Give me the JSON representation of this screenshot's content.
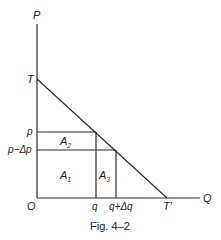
{
  "figure": {
    "caption": "Fig. 4–2",
    "axes": {
      "y_label": "P",
      "x_label": "Q",
      "origin_label": "O"
    },
    "points": {
      "t_label": "T",
      "t_prime_label": "T′",
      "p_label": "p",
      "p_minus_dp_label": "p−Δp",
      "q_label": "q",
      "q_plus_dq_label": "q+Δq"
    },
    "regions": {
      "a1": {
        "base": "A",
        "sub": "1"
      },
      "a2": {
        "base": "A",
        "sub": "2"
      },
      "a3": {
        "base": "A",
        "sub": "3"
      }
    }
  }
}
